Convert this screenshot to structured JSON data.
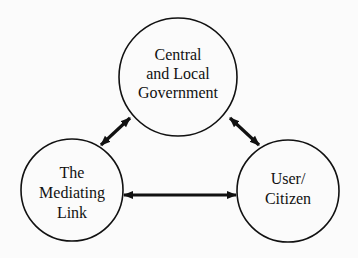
{
  "diagram": {
    "nodes": [
      {
        "id": "government",
        "lines": [
          "Central",
          "and Local",
          "Government"
        ]
      },
      {
        "id": "mediating-link",
        "lines": [
          "The",
          "Mediating",
          "Link"
        ]
      },
      {
        "id": "user-citizen",
        "lines": [
          "User/",
          "Citizen"
        ]
      }
    ],
    "edges": [
      {
        "from": "government",
        "to": "mediating-link",
        "type": "bidirectional"
      },
      {
        "from": "government",
        "to": "user-citizen",
        "type": "bidirectional"
      },
      {
        "from": "mediating-link",
        "to": "user-citizen",
        "type": "bidirectional"
      }
    ],
    "colors": {
      "stroke": "#111111",
      "background": "#fbfbfb"
    }
  }
}
